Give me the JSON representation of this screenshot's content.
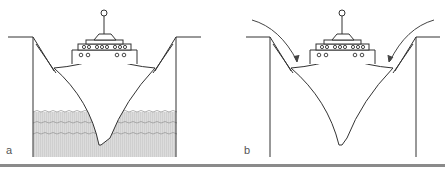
{
  "figure": {
    "panels": [
      {
        "label": "a",
        "description": "Ship in dry dock / lock with water filling lower portion"
      },
      {
        "label": "b",
        "description": "Ship in dry dock without water, arrows indicating inward forces on walls"
      }
    ],
    "colors": {
      "line": "#333333",
      "water_fill": "#d6d6d6",
      "water_wave": "#9a9a9a",
      "rule": "#8a8a8a"
    }
  }
}
